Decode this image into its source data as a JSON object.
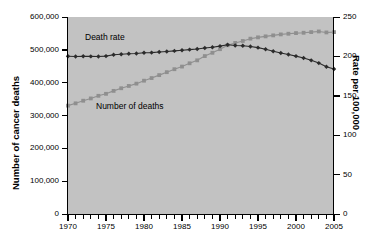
{
  "chart_data": {
    "type": "line",
    "title": "",
    "xlabel": "",
    "ylabel": "Number of cancer deaths",
    "y2label": "Rate per 100,000",
    "grid": false,
    "legend_position": "inline-annotation",
    "xlim": [
      1970,
      2005
    ],
    "ylim": [
      0,
      600000
    ],
    "y2lim": [
      0,
      250
    ],
    "x": [
      1970,
      1971,
      1972,
      1973,
      1974,
      1975,
      1976,
      1977,
      1978,
      1979,
      1980,
      1981,
      1982,
      1983,
      1984,
      1985,
      1986,
      1987,
      1988,
      1989,
      1990,
      1991,
      1992,
      1993,
      1994,
      1995,
      1996,
      1997,
      1998,
      1999,
      2000,
      2001,
      2002,
      2003,
      2004,
      2005
    ],
    "x_tick_labels": [
      "1970",
      "1975",
      "1980",
      "1985",
      "1990",
      "1995",
      "2000",
      "2005"
    ],
    "x_tick_values": [
      1970,
      1975,
      1980,
      1985,
      1990,
      1995,
      2000,
      2005
    ],
    "y_tick_labels": [
      "0",
      "100,000",
      "200,000",
      "300,000",
      "400,000",
      "500,000",
      "600,000"
    ],
    "y_tick_values": [
      0,
      100000,
      200000,
      300000,
      400000,
      500000,
      600000
    ],
    "y2_tick_labels": [
      "0",
      "50",
      "100",
      "150",
      "200",
      "250"
    ],
    "y2_tick_values": [
      0,
      50,
      100,
      150,
      200,
      250
    ],
    "series": [
      {
        "name": "Number of deaths",
        "axis": "left",
        "color": "#8f8f8f",
        "marker": "square",
        "annotation": "Number of deaths",
        "values": [
          330000,
          337000,
          345000,
          352000,
          360000,
          366000,
          375000,
          383000,
          390000,
          397000,
          406000,
          414000,
          423000,
          432000,
          441000,
          449000,
          459000,
          468000,
          481000,
          491000,
          502000,
          514000,
          521000,
          527000,
          534000,
          538000,
          541000,
          544000,
          547000,
          549000,
          551000,
          552000,
          554000,
          556000,
          553000,
          554000
        ]
      },
      {
        "name": "Death rate",
        "axis": "right",
        "color": "#2b2b2b",
        "marker": "diamond",
        "annotation": "Death rate",
        "values": [
          200.2,
          199.9,
          200.1,
          200.0,
          199.8,
          200.4,
          202.0,
          202.8,
          203.3,
          203.6,
          204.7,
          204.8,
          205.5,
          206.3,
          207.0,
          207.8,
          208.6,
          209.3,
          210.7,
          211.6,
          213.0,
          214.8,
          213.9,
          213.6,
          212.5,
          211.1,
          209.0,
          206.6,
          204.3,
          202.5,
          200.3,
          198.0,
          195.0,
          191.5,
          186.8,
          184.0
        ]
      }
    ]
  },
  "annotations": {
    "death_rate_label": "Death rate",
    "number_of_deaths_label": "Number of deaths"
  }
}
